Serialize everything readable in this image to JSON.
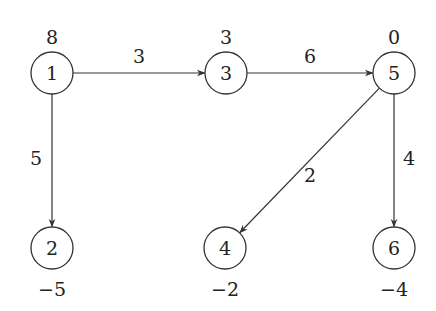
{
  "graph": {
    "nodes": [
      {
        "id": "1",
        "label": "1",
        "supply": "8",
        "x": 52,
        "y": 73,
        "supply_pos": "above"
      },
      {
        "id": "3",
        "label": "3",
        "supply": "3",
        "x": 226,
        "y": 73,
        "supply_pos": "above"
      },
      {
        "id": "5",
        "label": "5",
        "supply": "0",
        "x": 394,
        "y": 73,
        "supply_pos": "above"
      },
      {
        "id": "2",
        "label": "2",
        "supply": "−5",
        "x": 52,
        "y": 248,
        "supply_pos": "below"
      },
      {
        "id": "4",
        "label": "4",
        "supply": "−2",
        "x": 225,
        "y": 248,
        "supply_pos": "below"
      },
      {
        "id": "6",
        "label": "6",
        "supply": "−4",
        "x": 394,
        "y": 248,
        "supply_pos": "below"
      }
    ],
    "edges": [
      {
        "from": "1",
        "to": "3",
        "weight": "3",
        "lx": 139,
        "ly": 63
      },
      {
        "from": "3",
        "to": "5",
        "weight": "6",
        "lx": 310,
        "ly": 63
      },
      {
        "from": "1",
        "to": "2",
        "weight": "5",
        "lx": 36,
        "ly": 165
      },
      {
        "from": "5",
        "to": "4",
        "weight": "2",
        "lx": 310,
        "ly": 182
      },
      {
        "from": "5",
        "to": "6",
        "weight": "4",
        "lx": 409,
        "ly": 165
      }
    ]
  },
  "colors": {
    "stroke": "#333333",
    "text": "#222222",
    "background": "#ffffff"
  }
}
